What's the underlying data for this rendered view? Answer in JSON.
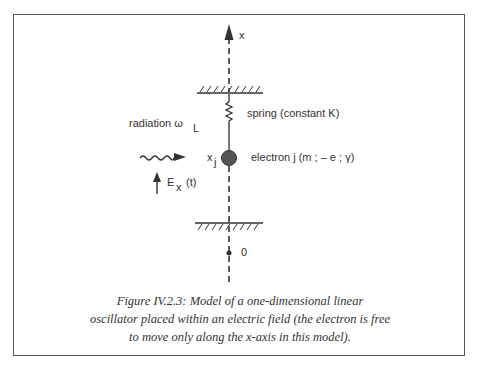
{
  "diagram": {
    "axis_label": "x",
    "origin_label": "0",
    "spring_label": "spring (constant K)",
    "radiation_label": "radiation ω",
    "radiation_subscript": "L",
    "position_label": "x",
    "position_subscript": "j",
    "electron_label": "electron j (m ; – e ; γ)",
    "field_label": "E",
    "field_subscript": "x",
    "field_arg": "(t)"
  },
  "caption": {
    "lines": [
      "Figure IV.2.3: Model of a one-dimensional linear",
      "oscillator placed within an electric field (the electron is free",
      "to move only along the x-axis in this model)."
    ]
  },
  "colors": {
    "ink": "#333333",
    "electron": "#555555",
    "frame": "#555555"
  }
}
